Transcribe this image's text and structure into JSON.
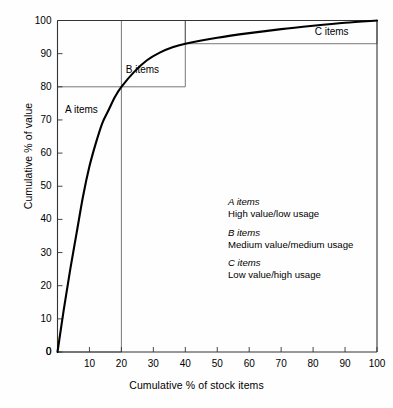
{
  "chart_data": {
    "type": "line",
    "title": "",
    "xlabel": "Cumulative % of stock items",
    "ylabel": "Cumulative % of value",
    "xlim": [
      0,
      100
    ],
    "ylim": [
      0,
      100
    ],
    "grid": false,
    "legend_position": "inside-right",
    "xticks": [
      "0",
      "10",
      "20",
      "30",
      "40",
      "50",
      "60",
      "70",
      "80",
      "90",
      "100"
    ],
    "yticks": [
      "0",
      "10",
      "20",
      "30",
      "40",
      "50",
      "60",
      "70",
      "80",
      "90",
      "100"
    ],
    "series": [
      {
        "name": "Cumulative value curve",
        "x": [
          0,
          2,
          4,
          6,
          8,
          10,
          12,
          14,
          16,
          18,
          20,
          24,
          28,
          32,
          36,
          40,
          50,
          60,
          70,
          80,
          90,
          100
        ],
        "values": [
          0,
          13,
          25,
          36,
          47,
          56,
          63,
          69,
          73,
          77,
          80,
          84.5,
          88,
          90.3,
          91.9,
          93,
          94.8,
          96.2,
          97.4,
          98.4,
          99.3,
          100
        ]
      }
    ],
    "annotations": [
      {
        "label": "A items",
        "x": 8,
        "y": 73
      },
      {
        "label": "B items",
        "x": 27,
        "y": 85
      },
      {
        "label": "C items",
        "x": 88,
        "y": 96.5
      }
    ],
    "zone_boxes": [
      {
        "name": "A",
        "x0": 0,
        "x1": 20,
        "y0": 0,
        "y1": 80
      },
      {
        "name": "B",
        "x0": 20,
        "x1": 40,
        "y0": 80,
        "y1": 100
      },
      {
        "name": "C",
        "x0": 40,
        "x1": 100,
        "y0": 93,
        "y1": 100
      }
    ]
  },
  "axis": {
    "y_title": "Cumulative % of value",
    "x_title": "Cumulative % of stock items"
  },
  "zones": {
    "a_label": "A items",
    "b_label": "B items",
    "c_label": "C items"
  },
  "legend": {
    "entries": [
      {
        "heading": "A items",
        "body": "High value/low usage"
      },
      {
        "heading": "B items",
        "body": "Medium value/medium usage"
      },
      {
        "heading": "C items",
        "body": "Low value/high usage"
      }
    ]
  },
  "colors": {
    "curve": "#000000",
    "axis": "#333333",
    "box": "#555555",
    "background": "#ffffff"
  }
}
